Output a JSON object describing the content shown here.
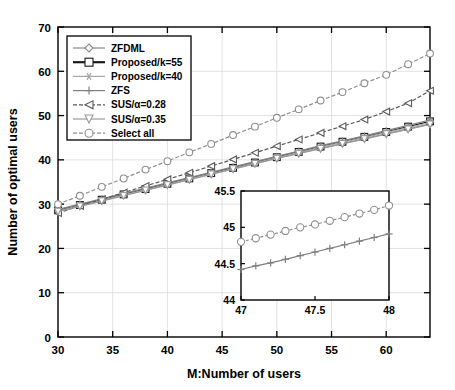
{
  "chart_data": {
    "type": "line",
    "title": "",
    "xlabel": "M:Number of users",
    "ylabel": "Number of optimal users",
    "xlim": [
      30,
      64
    ],
    "ylim": [
      0,
      70
    ],
    "xticks": [
      30,
      35,
      40,
      45,
      50,
      55,
      60
    ],
    "yticks": [
      0,
      10,
      20,
      30,
      40,
      50,
      60,
      70
    ],
    "grid": true,
    "legend_position": "upper-left",
    "x": [
      30,
      32,
      34,
      36,
      38,
      40,
      42,
      44,
      46,
      48,
      50,
      52,
      54,
      56,
      58,
      60,
      62,
      64
    ],
    "series": [
      {
        "name": "ZFDML",
        "marker": "diamond",
        "color": "#8c8c8c",
        "values": [
          28.4,
          29.6,
          30.8,
          32.0,
          33.2,
          34.4,
          35.6,
          36.8,
          38.0,
          39.2,
          40.4,
          41.5,
          42.6,
          43.7,
          44.8,
          45.9,
          47.0,
          48.1
        ]
      },
      {
        "name": "Proposed/k=55",
        "marker": "square",
        "color": "#1a1a1a",
        "values": [
          28.6,
          29.8,
          31.0,
          32.2,
          33.4,
          34.6,
          35.8,
          37.0,
          38.2,
          39.4,
          40.6,
          41.8,
          43.0,
          44.1,
          45.2,
          46.3,
          47.5,
          48.7
        ]
      },
      {
        "name": "Proposed/k=40",
        "marker": "asterisk",
        "color": "#a6a6a6",
        "values": [
          28.5,
          29.7,
          30.9,
          32.1,
          33.3,
          34.5,
          35.7,
          36.9,
          38.1,
          39.3,
          40.5,
          41.7,
          42.9,
          44.0,
          45.1,
          46.2,
          47.3,
          48.4
        ]
      },
      {
        "name": "ZFS",
        "marker": "plus",
        "color": "#808080",
        "values": [
          28.8,
          30.0,
          31.2,
          32.4,
          33.6,
          34.8,
          36.0,
          37.2,
          38.4,
          39.6,
          40.8,
          42.0,
          43.2,
          44.3,
          45.4,
          46.6,
          47.8,
          49.0
        ]
      },
      {
        "name": "SUS/α=0.28",
        "marker": "left-triangle",
        "color": "#595959",
        "values": [
          28.0,
          29.6,
          31.1,
          32.6,
          34.1,
          35.6,
          37.1,
          38.6,
          40.1,
          41.6,
          43.1,
          44.6,
          46.1,
          47.6,
          49.1,
          50.9,
          52.8,
          55.6
        ]
      },
      {
        "name": "SUS/α=0.35",
        "marker": "down-triangle",
        "color": "#9a9a9a",
        "values": [
          28.3,
          29.5,
          30.7,
          31.9,
          33.1,
          34.3,
          35.5,
          36.7,
          37.9,
          39.1,
          40.3,
          41.4,
          42.5,
          43.6,
          44.7,
          45.8,
          46.9,
          48.0
        ]
      },
      {
        "name": "Select all",
        "marker": "circle",
        "color": "#8f8f8f",
        "values": [
          30.0,
          31.9,
          33.9,
          35.8,
          37.8,
          39.7,
          41.7,
          43.6,
          45.6,
          47.5,
          49.5,
          51.4,
          53.4,
          55.3,
          57.3,
          59.2,
          61.6,
          64.0
        ]
      }
    ],
    "inset": {
      "xlim": [
        47,
        48
      ],
      "ylim": [
        44,
        45.5
      ],
      "xticks": [
        47,
        47.5,
        48
      ],
      "yticks": [
        44,
        44.5,
        45,
        45.5
      ],
      "x": [
        47.0,
        47.1,
        47.2,
        47.3,
        47.4,
        47.5,
        47.6,
        47.7,
        47.8,
        47.9,
        48.0
      ],
      "series": [
        {
          "name": "Select all",
          "marker": "circle",
          "color": "#8f8f8f",
          "values": [
            44.8,
            44.85,
            44.9,
            44.95,
            45.0,
            45.04,
            45.09,
            45.14,
            45.19,
            45.24,
            45.3
          ]
        },
        {
          "name": "ZFS",
          "marker": "plus",
          "color": "#808080",
          "values": [
            44.42,
            44.47,
            44.51,
            44.56,
            44.61,
            44.66,
            44.71,
            44.76,
            44.81,
            44.86,
            44.91
          ]
        }
      ]
    }
  },
  "legend": {
    "items": [
      {
        "label": "ZFDML",
        "marker": "diamond-icon"
      },
      {
        "label": "Proposed/k=55",
        "marker": "square-icon"
      },
      {
        "label": "Proposed/k=40",
        "marker": "asterisk-icon"
      },
      {
        "label": "ZFS",
        "marker": "plus-icon"
      },
      {
        "label": "SUS/α=0.28",
        "marker": "left-triangle-icon"
      },
      {
        "label": "SUS/α=0.35",
        "marker": "down-triangle-icon"
      },
      {
        "label": "Select all",
        "marker": "circle-icon"
      }
    ]
  },
  "axes": {
    "y_label": "Number of optimal users",
    "x_label": "M:Number of users",
    "x_tick_labels": [
      "30",
      "35",
      "40",
      "45",
      "50",
      "55",
      "60"
    ],
    "y_tick_labels": [
      "0",
      "10",
      "20",
      "30",
      "40",
      "50",
      "60",
      "70"
    ]
  },
  "inset_axes": {
    "x_tick_labels": [
      "47",
      "47.5",
      "48"
    ],
    "y_tick_labels": [
      "44",
      "44.5",
      "45",
      "45.5"
    ]
  }
}
